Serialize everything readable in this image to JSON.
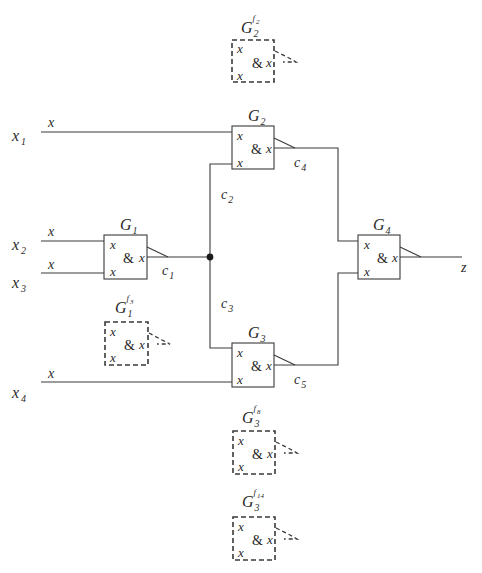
{
  "diagram": {
    "type": "logic-circuit-fault-model",
    "inputs": [
      {
        "name": "x",
        "sub": "1",
        "pin_label": "x"
      },
      {
        "name": "x",
        "sub": "2",
        "pin_label": "x"
      },
      {
        "name": "x",
        "sub": "3",
        "pin_label": "x"
      },
      {
        "name": "x",
        "sub": "4",
        "pin_label": "x"
      }
    ],
    "output": {
      "name": "z"
    },
    "gates": [
      {
        "id": "G1",
        "name": "G",
        "sub": "1",
        "op": "&",
        "in_a": "x",
        "in_b": "x",
        "out": "x"
      },
      {
        "id": "G2",
        "name": "G",
        "sub": "2",
        "op": "&",
        "in_a": "x",
        "in_b": "x",
        "out": "x"
      },
      {
        "id": "G3",
        "name": "G",
        "sub": "3",
        "op": "&",
        "in_a": "x",
        "in_b": "x",
        "out": "x"
      },
      {
        "id": "G4",
        "name": "G",
        "sub": "4",
        "op": "&",
        "in_a": "x",
        "in_b": "x",
        "out": "x"
      }
    ],
    "connections": [
      {
        "name": "c",
        "sub": "1"
      },
      {
        "name": "c",
        "sub": "2"
      },
      {
        "name": "c",
        "sub": "3"
      },
      {
        "name": "c",
        "sub": "4"
      },
      {
        "name": "c",
        "sub": "5"
      }
    ],
    "faulty_gates": [
      {
        "name": "G",
        "sub": "2",
        "sup": "f",
        "sup_sub": "2",
        "op": "&",
        "in_a": "x",
        "in_b": "x",
        "out": "x"
      },
      {
        "name": "G",
        "sub": "1",
        "sup": "f",
        "sup_sub": "3",
        "op": "&",
        "in_a": "x",
        "in_b": "x",
        "out": "x"
      },
      {
        "name": "G",
        "sub": "3",
        "sup": "f",
        "sup_sub": "8",
        "op": "&",
        "in_a": "x",
        "in_b": "x",
        "out": "x"
      },
      {
        "name": "G",
        "sub": "3",
        "sup": "f",
        "sup_sub": "14",
        "op": "&",
        "in_a": "x",
        "in_b": "x",
        "out": "x"
      }
    ]
  }
}
